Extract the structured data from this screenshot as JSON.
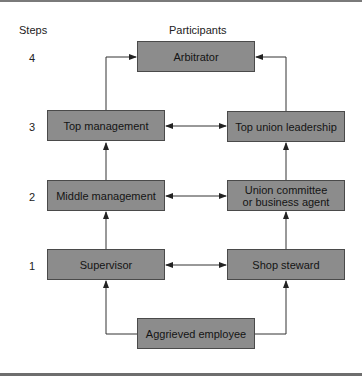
{
  "headers": {
    "steps": "Steps",
    "participants": "Participants"
  },
  "steps": [
    "4",
    "3",
    "2",
    "1"
  ],
  "nodes": {
    "arbitrator": "Arbitrator",
    "top_management": "Top management",
    "top_union_leadership": "Top union leadership",
    "middle_management": "Middle management",
    "union_committee_line1": "Union committee",
    "union_committee_line2": "or business agent",
    "supervisor": "Supervisor",
    "shop_steward": "Shop steward",
    "aggrieved_employee": "Aggrieved employee"
  },
  "edges": [
    {
      "from": "aggrieved_employee",
      "to": "supervisor",
      "type": "elbow"
    },
    {
      "from": "aggrieved_employee",
      "to": "shop_steward",
      "type": "elbow"
    },
    {
      "from": "supervisor",
      "to": "middle_management",
      "type": "up"
    },
    {
      "from": "middle_management",
      "to": "top_management",
      "type": "up"
    },
    {
      "from": "top_management",
      "to": "arbitrator",
      "type": "elbow"
    },
    {
      "from": "shop_steward",
      "to": "union_committee",
      "type": "up"
    },
    {
      "from": "union_committee",
      "to": "top_union_leadership",
      "type": "up"
    },
    {
      "from": "top_union_leadership",
      "to": "arbitrator",
      "type": "elbow"
    },
    {
      "from": "supervisor",
      "to": "shop_steward",
      "type": "bidirectional"
    },
    {
      "from": "middle_management",
      "to": "union_committee",
      "type": "bidirectional"
    },
    {
      "from": "top_management",
      "to": "top_union_leadership",
      "type": "bidirectional"
    }
  ],
  "colors": {
    "box_fill": "#8c8c8c",
    "box_border": "#4a4a4a",
    "line": "#333333"
  }
}
